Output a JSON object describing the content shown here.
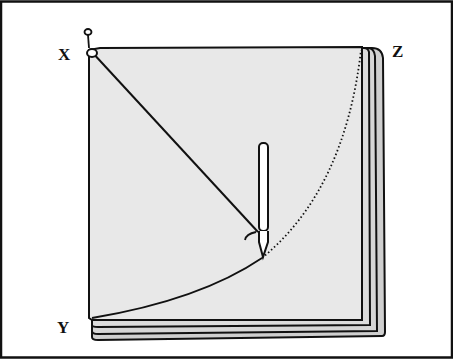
{
  "figure": {
    "labels": {
      "x": "X",
      "y": "Y",
      "z": "Z"
    },
    "colors": {
      "paper": "#e8e8e8",
      "layer": "#cfcfcf",
      "ink": "#111111",
      "frame": "#111111"
    },
    "elements": [
      "pin at X",
      "string from X to pencil",
      "pencil",
      "arc from Y to Z (solid then dotted)",
      "stacked paper sheets"
    ]
  }
}
